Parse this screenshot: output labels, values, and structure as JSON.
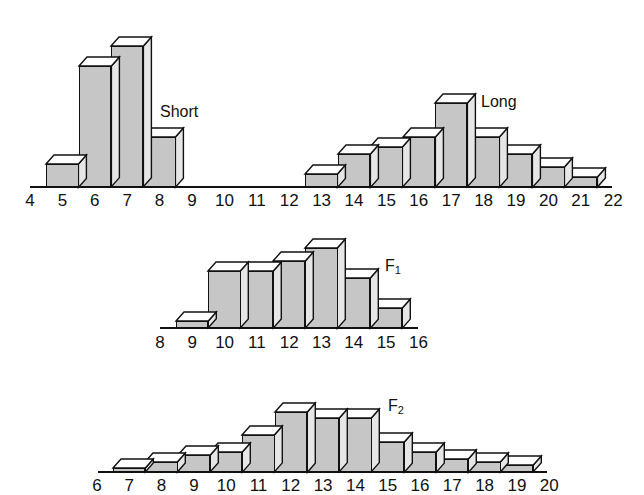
{
  "chart_data": [
    {
      "type": "bar",
      "title": "",
      "series_label": "Short",
      "xlabel": "",
      "ylabel": "",
      "categories": [
        5,
        6,
        7,
        8
      ],
      "values": [
        7,
        36,
        42,
        15
      ],
      "value_unit": "approx. % of plants (estimated from bar heights)",
      "axis_ticks": [
        4,
        5,
        6,
        7,
        8,
        9,
        10,
        11,
        12,
        13,
        14,
        15,
        16,
        17,
        18,
        19,
        20,
        21,
        22
      ],
      "grid": false,
      "style": "3d-bar"
    },
    {
      "type": "bar",
      "title": "",
      "series_label": "Long",
      "xlabel": "",
      "ylabel": "",
      "categories": [
        13,
        14,
        15,
        16,
        17,
        18,
        19,
        20,
        21
      ],
      "values": [
        4,
        10,
        12,
        15,
        25,
        15,
        10,
        6,
        3
      ],
      "value_unit": "approx. % of plants (estimated from bar heights)",
      "axis_ticks": [
        4,
        5,
        6,
        7,
        8,
        9,
        10,
        11,
        12,
        13,
        14,
        15,
        16,
        17,
        18,
        19,
        20,
        21,
        22
      ],
      "grid": false,
      "style": "3d-bar"
    },
    {
      "type": "bar",
      "title": "",
      "series_label": "F1",
      "xlabel": "",
      "ylabel": "",
      "categories": [
        9,
        10,
        11,
        12,
        13,
        14,
        15
      ],
      "values": [
        2,
        17,
        17,
        20,
        24,
        15,
        6
      ],
      "value_unit": "approx. % of plants (estimated from bar heights)",
      "axis_ticks": [
        8,
        9,
        10,
        11,
        12,
        13,
        14,
        15,
        16
      ],
      "grid": false,
      "style": "3d-bar"
    },
    {
      "type": "bar",
      "title": "",
      "series_label": "F2",
      "xlabel": "",
      "ylabel": "",
      "categories": [
        7,
        8,
        9,
        10,
        11,
        12,
        13,
        14,
        15,
        16,
        17,
        18,
        19
      ],
      "values": [
        1,
        3,
        5,
        6,
        11,
        18,
        16,
        16,
        9,
        6,
        4,
        3,
        2
      ],
      "value_unit": "approx. % of plants (estimated from bar heights)",
      "axis_ticks": [
        6,
        7,
        8,
        9,
        10,
        11,
        12,
        13,
        14,
        15,
        16,
        17,
        18,
        19,
        20
      ],
      "grid": false,
      "style": "3d-bar"
    }
  ],
  "labels": {
    "short": "Short",
    "long": "Long",
    "f1_main": "F",
    "f1_sub": "1",
    "f2_main": "F",
    "f2_sub": "2"
  },
  "colors": {
    "front": "#c6c6c6",
    "top": "#ffffff",
    "side": "#e6e6e6",
    "outline": "#111111"
  },
  "layout": {
    "px_per_unit": 3.35,
    "panels": [
      {
        "baseline_y": 187,
        "x_at_first_tick": 30,
        "tick_spacing": 32.4,
        "axis_x0": 30,
        "axis_x1": 612,
        "label_y": 192
      },
      {
        "baseline_y": 187,
        "x_at_first_tick": 30,
        "tick_spacing": 32.4,
        "axis_x0": 30,
        "axis_x1": 612,
        "label_y": 192
      },
      {
        "baseline_y": 328,
        "x_at_first_tick": 160,
        "tick_spacing": 32.3,
        "axis_x0": 160,
        "axis_x1": 418,
        "label_y": 334
      },
      {
        "baseline_y": 472,
        "x_at_first_tick": 97,
        "tick_spacing": 32.3,
        "axis_x0": 98,
        "axis_x1": 547,
        "label_y": 477
      }
    ]
  }
}
